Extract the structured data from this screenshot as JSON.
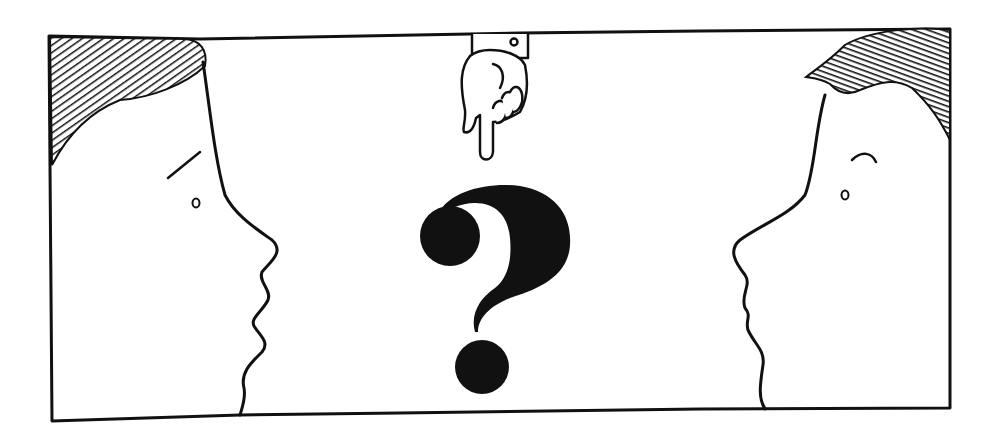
{
  "illustration": {
    "description": "Cartoon panel: two facing profiles with a pointing hand above a large question mark",
    "ink_color": "#111111",
    "paper_color": "#ffffff",
    "elements": [
      {
        "name": "left-profile-face",
        "label": "Left person facing right"
      },
      {
        "name": "right-profile-face",
        "label": "Right person facing left"
      },
      {
        "name": "pointing-hand-icon",
        "label": "Hand pointing down"
      },
      {
        "name": "question-mark-icon",
        "label": "Question mark",
        "glyph": "?"
      }
    ]
  }
}
